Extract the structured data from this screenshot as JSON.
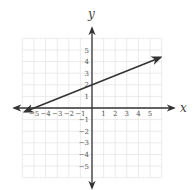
{
  "chart_data": {
    "type": "line",
    "title": "",
    "xlabel": "x",
    "ylabel": "y",
    "xlim": [
      -6,
      6
    ],
    "ylim": [
      -6,
      6
    ],
    "grid": true,
    "x_ticks": [
      -5,
      -4,
      -3,
      -2,
      -1,
      1,
      2,
      3,
      4,
      5
    ],
    "y_ticks": [
      5,
      4,
      3,
      2,
      1,
      -1,
      -2,
      -3,
      -4,
      -5
    ],
    "x_tick_labels": [
      "−5",
      "−4",
      "−3",
      "−2",
      "−1",
      "1",
      "2",
      "3",
      "4",
      "5"
    ],
    "y_tick_labels": [
      "5",
      "4",
      "3",
      "2",
      "1",
      "−1",
      "−2",
      "−3",
      "−4",
      "−5"
    ],
    "series": [
      {
        "name": "line",
        "equation": "y = 0.4x + 2",
        "slope": 0.4,
        "intercept": 2,
        "points": [
          [
            -5,
            0
          ],
          [
            0,
            2
          ],
          [
            5,
            4
          ]
        ],
        "arrows": "both",
        "color": "#333333"
      }
    ]
  },
  "labels": {
    "x_axis": "x",
    "y_axis": "y"
  }
}
